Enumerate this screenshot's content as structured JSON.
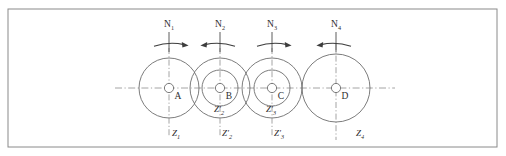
{
  "figure": {
    "frame": {
      "x": 8,
      "y": 9,
      "width": 489,
      "height": 138,
      "stroke": "#8a8a8a"
    },
    "colors": {
      "outline": "#6d6d6d",
      "centerline": "#8d8d8d",
      "arrow": "#3d3d3d",
      "text": "#2e2e2e",
      "background": "#ffffff"
    },
    "centerline": {
      "y": 88,
      "x_start": 115,
      "x_end": 395
    },
    "shafts": [
      {
        "name": "shaft-a",
        "center_label": "A",
        "cx": 169,
        "cy": 88,
        "hub_r": 4.6,
        "gears": [
          {
            "label": "Z",
            "subscript": "1",
            "radius": 30,
            "prime": false
          }
        ],
        "speed": {
          "label": "N",
          "subscript": "1",
          "direction": "right",
          "label_x": 169,
          "label_y": 27,
          "stem_top": 32,
          "stem_bottom": 52,
          "arrow_y": 44
        },
        "bottom_label": {
          "text": "Z",
          "subscript": "1",
          "prime": false,
          "x": 176,
          "y": 136
        }
      },
      {
        "name": "shaft-b",
        "center_label": "B",
        "cx": 220,
        "cy": 88,
        "hub_r": 4.6,
        "gears": [
          {
            "label": "Z",
            "subscript": "2",
            "radius": 30,
            "prime": false
          },
          {
            "label": "Z",
            "subscript": "2",
            "radius": 18,
            "prime": true
          }
        ],
        "speed": {
          "label": "N",
          "subscript": "2",
          "direction": "left",
          "label_x": 220,
          "label_y": 27,
          "stem_top": 32,
          "stem_bottom": 52,
          "arrow_y": 44
        },
        "bottom_label": {
          "text": "Z",
          "subscript": "2",
          "prime": true,
          "x": 227,
          "y": 136
        }
      },
      {
        "name": "shaft-c",
        "center_label": "C",
        "cx": 272,
        "cy": 88,
        "hub_r": 4.6,
        "gears": [
          {
            "label": "Z",
            "subscript": "3",
            "radius": 30,
            "prime": false
          },
          {
            "label": "Z",
            "subscript": "3",
            "radius": 18,
            "prime": true
          }
        ],
        "speed": {
          "label": "N",
          "subscript": "3",
          "direction": "right",
          "label_x": 272,
          "label_y": 27,
          "stem_top": 32,
          "stem_bottom": 52,
          "arrow_y": 44
        },
        "bottom_label": {
          "text": "Z",
          "subscript": "3",
          "prime": true,
          "x": 279,
          "y": 136
        }
      },
      {
        "name": "shaft-d",
        "center_label": "D",
        "cx": 336,
        "cy": 88,
        "hub_r": 4.6,
        "gears": [
          {
            "label": "Z",
            "subscript": "4",
            "radius": 34,
            "prime": false
          }
        ],
        "speed": {
          "label": "N",
          "subscript": "4",
          "direction": "left",
          "label_x": 336,
          "label_y": 27,
          "stem_top": 32,
          "stem_bottom": 52,
          "arrow_y": 44
        },
        "bottom_label": {
          "text": "Z",
          "subscript": "4",
          "prime": false,
          "x": 360,
          "y": 136
        }
      }
    ],
    "inner_labels": [
      {
        "name": "inner-label-z2-prime",
        "text": "Z",
        "subscript": "2",
        "prime": true,
        "x": 219,
        "y": 112
      },
      {
        "name": "inner-label-z3-prime",
        "text": "Z",
        "subscript": "3",
        "prime": true,
        "x": 271,
        "y": 112
      }
    ]
  }
}
